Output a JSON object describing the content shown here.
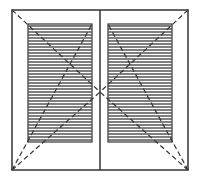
{
  "diagram": {
    "panels": [
      {
        "name": "left-sash",
        "glazing": "horizontal-hatched",
        "opening_lines": "dashed"
      },
      {
        "name": "right-sash",
        "glazing": "horizontal-hatched",
        "opening_lines": "dashed"
      }
    ],
    "colors": {
      "line": "#333333",
      "hatch": "#555555",
      "background": "#ffffff"
    }
  }
}
